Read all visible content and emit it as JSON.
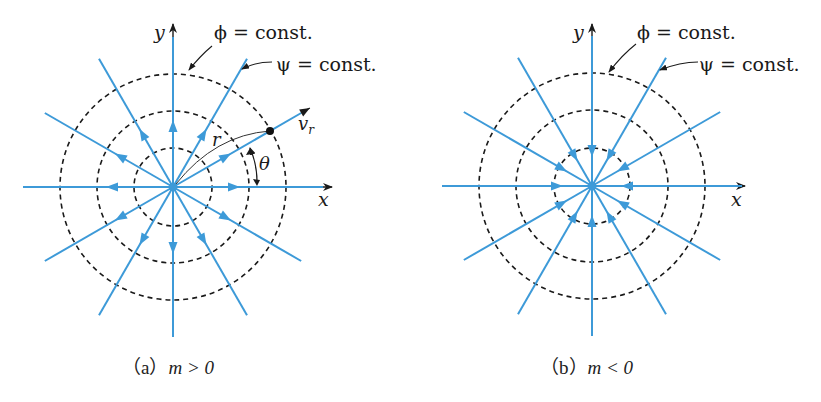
{
  "colors": {
    "streamline": "#3d9ad8",
    "equipotential": "#1a1a1a",
    "axis": "#1a1a1a"
  },
  "panels": [
    {
      "id": "a",
      "caption": "（a） m > 0",
      "caption_prefix": "（a）",
      "caption_math": "m > 0",
      "axis_x": "x",
      "axis_y": "y",
      "label_phi": "ϕ = const.",
      "label_psi": "ψ = const.",
      "label_r": "r",
      "label_theta": "θ",
      "label_vr": "v",
      "label_vr_sub": "r",
      "flow": "outward"
    },
    {
      "id": "b",
      "caption": "（b） m < 0",
      "caption_prefix": "（b）",
      "caption_math": "m < 0",
      "axis_x": "x",
      "axis_y": "y",
      "label_phi": "ϕ = const.",
      "label_psi": "ψ = const.",
      "flow": "inward"
    }
  ]
}
